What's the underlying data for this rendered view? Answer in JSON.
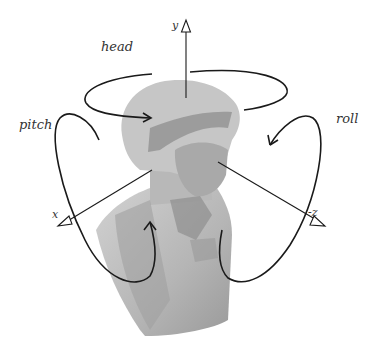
{
  "figure": {
    "colors": {
      "background": "#ffffff",
      "bust_light": "#c9c9c9",
      "bust_mid": "#a8a8a8",
      "bust_dark": "#7e7e7e",
      "lines": "#1a1a1a",
      "text": "#333333"
    }
  },
  "axes": [
    {
      "id": "y",
      "label": "y",
      "direction": "up"
    },
    {
      "id": "x",
      "label": "x",
      "direction": "lower-left"
    },
    {
      "id": "neg_z",
      "label": "-z",
      "direction": "lower-right"
    }
  ],
  "rotations": [
    {
      "id": "head",
      "label": "head",
      "about_axis": "y"
    },
    {
      "id": "pitch",
      "label": "pitch",
      "about_axis": "x"
    },
    {
      "id": "roll",
      "label": "roll",
      "about_axis": "-z"
    }
  ]
}
